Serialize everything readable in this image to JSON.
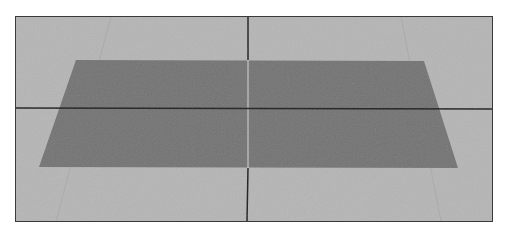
{
  "figure": {
    "colors": {
      "background": "#b5b5b5",
      "plane": "#727272",
      "axes": "#1c1c1c",
      "frame_border": "#3a3a3a"
    },
    "plane_corners": {
      "top_left": [
        75,
        59
      ],
      "top_right": [
        423,
        60
      ],
      "bottom_right": [
        457,
        167
      ],
      "bottom_left": [
        38,
        166
      ]
    },
    "crosshair": {
      "vertical_x": 247,
      "horizontal_y": 107
    },
    "caption": ""
  }
}
